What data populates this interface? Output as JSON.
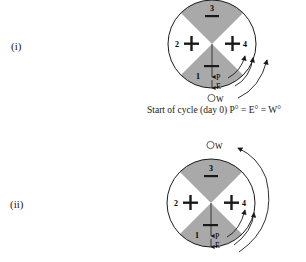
{
  "panels": [
    {
      "label": "(i)",
      "quadrants": [
        {
          "number": "1",
          "sign": "−",
          "shade": "gray"
        },
        {
          "number": "2",
          "sign": "+",
          "shade": "white"
        },
        {
          "number": "3",
          "sign": "−",
          "shade": "gray"
        },
        {
          "number": "4",
          "sign": "+",
          "shade": "white"
        }
      ],
      "markers": {
        "p": "P",
        "e": "E",
        "w": "W"
      },
      "caption": "Start of cycle (day 0) P° = E° = W°"
    },
    {
      "label": "(ii)",
      "quadrants": [
        {
          "number": "1",
          "sign": "−",
          "shade": "gray"
        },
        {
          "number": "2",
          "sign": "+",
          "shade": "white"
        },
        {
          "number": "3",
          "sign": "−",
          "shade": "gray"
        },
        {
          "number": "4",
          "sign": "+",
          "shade": "white"
        }
      ],
      "markers": {
        "p": "P",
        "e": "E",
        "w": "W"
      }
    }
  ],
  "colors": {
    "shade_gray": "#a9a9a9",
    "stroke": "#1a1a1a",
    "background": "#ffffff"
  }
}
